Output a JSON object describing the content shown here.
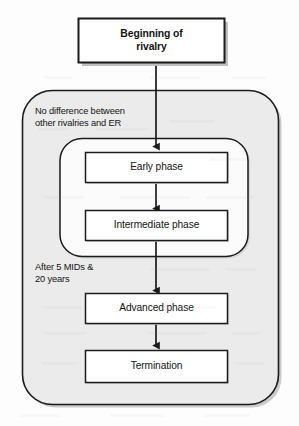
{
  "diagram": {
    "type": "flowchart",
    "nodes": [
      {
        "id": "start",
        "label": "Beginning of\nrivalry",
        "shape": "rectangle-shadow",
        "emphasis": "bold"
      },
      {
        "id": "early",
        "label": "Early phase",
        "shape": "rectangle",
        "emphasis": "normal"
      },
      {
        "id": "intermediate",
        "label": "Intermediate phase",
        "shape": "rectangle",
        "emphasis": "normal"
      },
      {
        "id": "advanced",
        "label": "Advanced phase",
        "shape": "rectangle",
        "emphasis": "normal"
      },
      {
        "id": "termination",
        "label": "Termination",
        "shape": "rectangle",
        "emphasis": "normal"
      }
    ],
    "edge_labels": [
      {
        "id": "no-difference",
        "text": "No difference between\nother rivalries and ER"
      },
      {
        "id": "after-mids",
        "text": "After 5 MIDs &\n20 years"
      }
    ],
    "groups": [
      {
        "id": "outer-group",
        "shape": "rounded-rectangle",
        "fill": "#ebebeb"
      },
      {
        "id": "inner-group",
        "shape": "rounded-rectangle",
        "fill": "#fbfbfb"
      }
    ],
    "connectors": [
      {
        "from": "start",
        "to": "early",
        "style": "arrow-down"
      },
      {
        "from": "early",
        "to": "intermediate",
        "style": "arrow-down"
      },
      {
        "from": "intermediate",
        "to": "advanced",
        "style": "arrow-down"
      },
      {
        "from": "advanced",
        "to": "termination",
        "style": "arrow-down"
      }
    ],
    "colors": {
      "stroke": "#1a1a1a",
      "box_fill": "#ffffff",
      "outer_group_fill": "#ebebeb",
      "inner_group_fill": "#fbfbfb",
      "shadow": "#b9b9b9",
      "text": "#141414",
      "page": "#fdfdfd"
    }
  }
}
